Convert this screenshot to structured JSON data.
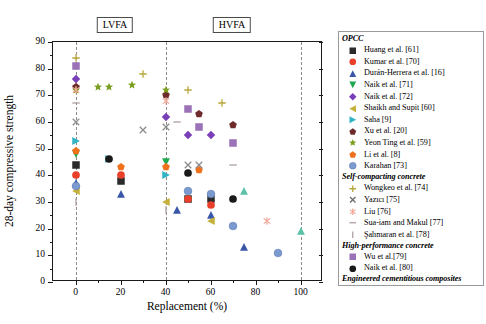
{
  "chart_data": {
    "type": "scatter",
    "title": "",
    "xlabel": "Replacement (%)",
    "ylabel": "28-day compressive strength",
    "xlim": [
      -10,
      110
    ],
    "ylim": [
      0,
      90
    ],
    "xticks": [
      0,
      20,
      40,
      60,
      80,
      100
    ],
    "yticks": [
      0,
      10,
      20,
      30,
      40,
      50,
      60,
      70,
      80,
      90
    ],
    "grid": false,
    "legend_position": "right-outside",
    "reference_lines": [
      {
        "x": 0,
        "style": "dashed"
      },
      {
        "x": 40,
        "style": "dashed"
      },
      {
        "x": 100,
        "style": "dashed"
      }
    ],
    "annotations": [
      {
        "text": "LVFA",
        "x": 18,
        "y": 93,
        "boxed": true
      },
      {
        "text": "HVFA",
        "x": 70,
        "y": 93,
        "boxed": true
      }
    ],
    "series": [
      {
        "name": "Huang et al. [61]",
        "group": "OPCC",
        "marker": "square",
        "color": "#2b2b2b",
        "points": [
          [
            0,
            44
          ],
          [
            20,
            38
          ],
          [
            50,
            31
          ],
          [
            60,
            31
          ]
        ]
      },
      {
        "name": "Kumar et al. [70]",
        "group": "OPCC",
        "marker": "circle",
        "color": "#e8402a",
        "points": [
          [
            0,
            40
          ],
          [
            20,
            40
          ],
          [
            50,
            31
          ],
          [
            60,
            29
          ]
        ]
      },
      {
        "name": "Durán-Herrera et al. [16]",
        "group": "OPCC",
        "marker": "triangle-up",
        "color": "#3a56a8",
        "points": [
          [
            0,
            37
          ],
          [
            20,
            33
          ],
          [
            45,
            27
          ],
          [
            60,
            25
          ],
          [
            75,
            13
          ]
        ]
      },
      {
        "name": "Naik et al. [71]",
        "group": "OPCC",
        "marker": "triangle-down",
        "color": "#1fa84f",
        "points": [
          [
            0,
            48
          ],
          [
            40,
            45
          ]
        ]
      },
      {
        "name": "Naik et al. [72]",
        "group": "OPCC",
        "marker": "diamond",
        "color": "#7a3fb8",
        "points": [
          [
            0,
            76
          ],
          [
            40,
            62
          ],
          [
            50,
            55
          ],
          [
            60,
            55
          ]
        ]
      },
      {
        "name": "Shaikh and Supit [60]",
        "group": "OPCC",
        "marker": "triangle-left",
        "color": "#c6b13a",
        "points": [
          [
            0,
            34
          ],
          [
            40,
            30
          ],
          [
            60,
            23
          ]
        ]
      },
      {
        "name": "Saha [9]",
        "group": "OPCC",
        "marker": "triangle-right",
        "color": "#31b5c4",
        "points": [
          [
            0,
            53
          ],
          [
            15,
            46
          ],
          [
            40,
            40
          ]
        ]
      },
      {
        "name": "Xu et al. [20]",
        "group": "OPCC",
        "marker": "pentagon",
        "color": "#6e2b2b",
        "points": [
          [
            0,
            73
          ],
          [
            40,
            70
          ],
          [
            55,
            63
          ],
          [
            70,
            59
          ]
        ]
      },
      {
        "name": "Yeon Ting et al. [59]",
        "group": "OPCC",
        "marker": "star",
        "color": "#7a9e1e",
        "points": [
          [
            0,
            72
          ],
          [
            10,
            73
          ],
          [
            15,
            73
          ],
          [
            25,
            74
          ],
          [
            40,
            72
          ]
        ]
      },
      {
        "name": "Li et al. [8]",
        "group": "OPCC",
        "marker": "pentagon",
        "color": "#f0711c",
        "points": [
          [
            0,
            49
          ],
          [
            20,
            43
          ],
          [
            40,
            43
          ],
          [
            55,
            42
          ]
        ]
      },
      {
        "name": "Karahan [73]",
        "group": "OPCC",
        "marker": "circle-3d",
        "color": "#7b9ad0",
        "points": [
          [
            0,
            36
          ],
          [
            50,
            34
          ],
          [
            60,
            33
          ],
          [
            70,
            21
          ],
          [
            90,
            11
          ]
        ]
      },
      {
        "name": "Wongkeo et al. [74]",
        "group": "Self-compacting concrete",
        "marker": "plus",
        "color": "#b8a83c",
        "points": [
          [
            0,
            84
          ],
          [
            30,
            78
          ],
          [
            50,
            72
          ],
          [
            65,
            67
          ]
        ]
      },
      {
        "name": "Yazıcı [75]",
        "group": "Self-compacting concrete",
        "marker": "cross",
        "color": "#8b8b8b",
        "points": [
          [
            0,
            60
          ],
          [
            30,
            57
          ],
          [
            40,
            58
          ],
          [
            50,
            44
          ],
          [
            55,
            44
          ]
        ]
      },
      {
        "name": "Liu [76]",
        "group": "Self-compacting concrete",
        "marker": "asterisk",
        "color": "#f0a898",
        "points": [
          [
            0,
            72
          ],
          [
            40,
            68
          ],
          [
            85,
            23
          ]
        ]
      },
      {
        "name": "Sua-iam and Makul [77]",
        "group": "Self-compacting concrete",
        "marker": "hline",
        "color": "#b0a0a0",
        "points": [
          [
            0,
            67
          ],
          [
            45,
            60
          ],
          [
            70,
            44
          ]
        ]
      },
      {
        "name": "Şahmaran et al. [78]",
        "group": "Self-compacting concrete",
        "marker": "vline",
        "color": "#b0a0a0",
        "points": [
          [
            0,
            30
          ],
          [
            40,
            27
          ]
        ]
      },
      {
        "name": "Wu et al.[79]",
        "group": "High-performance concrete",
        "marker": "square",
        "color": "#9b72b8",
        "points": [
          [
            0,
            81
          ],
          [
            50,
            65
          ],
          [
            55,
            58
          ],
          [
            70,
            52
          ]
        ]
      },
      {
        "name": "Naik et al. [80]",
        "group": "High-performance concrete",
        "marker": "circle",
        "color": "#1a1a1a",
        "points": [
          [
            15,
            46
          ],
          [
            50,
            41
          ],
          [
            70,
            31
          ]
        ]
      },
      {
        "name": "Ammasi and Ragul [81]",
        "group": "Engineered cementitious composites",
        "marker": "triangle-up",
        "color": "#5cc1a8",
        "points": [
          [
            75,
            34
          ],
          [
            100,
            19
          ]
        ]
      }
    ]
  },
  "legend": {
    "sections": [
      {
        "header": "OPCC",
        "items": [
          {
            "label": "Huang et al. [61]",
            "marker": "square",
            "color": "#2b2b2b"
          },
          {
            "label": "Kumar et al. [70]",
            "marker": "circle",
            "color": "#e8402a"
          },
          {
            "label": "Durán-Herrera et al. [16]",
            "marker": "triangle-up",
            "color": "#3a56a8"
          },
          {
            "label": "Naik et al. [71]",
            "marker": "triangle-down",
            "color": "#1fa84f"
          },
          {
            "label": "Naik et al. [72]",
            "marker": "diamond",
            "color": "#7a3fb8"
          },
          {
            "label": "Shaikh and Supit [60]",
            "marker": "triangle-left",
            "color": "#c6b13a"
          },
          {
            "label": "Saha [9]",
            "marker": "triangle-right",
            "color": "#31b5c4"
          },
          {
            "label": "Xu et al. [20]",
            "marker": "pentagon",
            "color": "#6e2b2b"
          },
          {
            "label": "Yeon Ting et al. [59]",
            "marker": "star",
            "color": "#7a9e1e"
          },
          {
            "label": "Li et al. [8]",
            "marker": "pentagon",
            "color": "#f0711c"
          },
          {
            "label": "Karahan [73]",
            "marker": "circle-3d",
            "color": "#7b9ad0"
          }
        ]
      },
      {
        "header": "Self-compacting concrete",
        "items": [
          {
            "label": "Wongkeo et al. [74]",
            "marker": "plus",
            "color": "#b8a83c"
          },
          {
            "label": "Yazıcı [75]",
            "marker": "cross",
            "color": "#6a6a6a"
          },
          {
            "label": "Liu [76]",
            "marker": "asterisk",
            "color": "#f0a898"
          },
          {
            "label": "Sua-iam and Makul [77]",
            "marker": "hline",
            "color": "#b0a0a0"
          },
          {
            "label": "Şahmaran et al. [78]",
            "marker": "vline",
            "color": "#b0a0a0"
          }
        ]
      },
      {
        "header": "High-performance concrete",
        "items": [
          {
            "label": "Wu et al.[79]",
            "marker": "square",
            "color": "#9b72b8"
          },
          {
            "label": "Naik et al. [80]",
            "marker": "circle",
            "color": "#1a1a1a"
          }
        ]
      },
      {
        "header": "Engineered cementitious composites",
        "items": [
          {
            "label": "Ammasi and Ragul [81]",
            "marker": "triangle-up",
            "color": "#5cc1a8"
          }
        ]
      }
    ]
  }
}
